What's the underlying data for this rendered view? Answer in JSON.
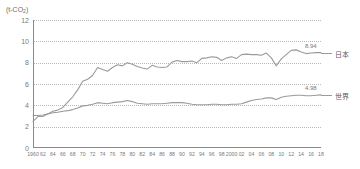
{
  "chart_data": {
    "type": "line",
    "title": "",
    "subtitle": "",
    "unit_label": "(t-CO2)",
    "unit_label_base": "(t-CO",
    "unit_label_sub": "2",
    "unit_label_tail": ")",
    "xlabel": "",
    "ylabel": "",
    "ylim": [
      0,
      12
    ],
    "xlim": [
      1960,
      2018
    ],
    "grid": true,
    "legend_position": "right-inline",
    "y_ticks": [
      "12",
      "10",
      "8",
      "6",
      "4",
      "2",
      "0"
    ],
    "y_tick_values": [
      12,
      10,
      8,
      6,
      4,
      2,
      0
    ],
    "x_ticks": [
      "1960",
      "62",
      "64",
      "66",
      "68",
      "70",
      "72",
      "74",
      "76",
      "78",
      "80",
      "82",
      "84",
      "86",
      "88",
      "90",
      "92",
      "94",
      "96",
      "98",
      "2000",
      "02",
      "04",
      "06",
      "08",
      "10",
      "12",
      "14",
      "16",
      "18"
    ],
    "x_tick_values": [
      1960,
      1962,
      1964,
      1966,
      1968,
      1970,
      1972,
      1974,
      1976,
      1978,
      1980,
      1982,
      1984,
      1986,
      1988,
      1990,
      1992,
      1994,
      1996,
      1998,
      2000,
      2002,
      2004,
      2006,
      2008,
      2010,
      2012,
      2014,
      2016,
      2018
    ],
    "x": [
      1960,
      1961,
      1962,
      1963,
      1964,
      1965,
      1966,
      1967,
      1968,
      1969,
      1970,
      1971,
      1972,
      1973,
      1974,
      1975,
      1976,
      1977,
      1978,
      1979,
      1980,
      1981,
      1982,
      1983,
      1984,
      1985,
      1986,
      1987,
      1988,
      1989,
      1990,
      1991,
      1992,
      1993,
      1994,
      1995,
      1996,
      1997,
      1998,
      1999,
      2000,
      2001,
      2002,
      2003,
      2004,
      2005,
      2006,
      2007,
      2008,
      2009,
      2010,
      2011,
      2012,
      2013,
      2014,
      2015,
      2016,
      2017,
      2018
    ],
    "series": [
      {
        "name": "日本",
        "color": "#9a9a9a",
        "end_value_label": "8.94",
        "end_value": 8.94,
        "values": [
          2.5,
          2.95,
          2.95,
          3.2,
          3.45,
          3.55,
          3.8,
          4.3,
          4.8,
          5.45,
          6.25,
          6.45,
          6.8,
          7.55,
          7.35,
          7.2,
          7.55,
          7.8,
          7.7,
          8.0,
          7.85,
          7.65,
          7.5,
          7.4,
          7.75,
          7.6,
          7.55,
          7.6,
          8.05,
          8.2,
          8.1,
          8.1,
          8.15,
          8.0,
          8.4,
          8.45,
          8.55,
          8.5,
          8.2,
          8.45,
          8.55,
          8.4,
          8.75,
          8.8,
          8.75,
          8.75,
          8.7,
          8.9,
          8.45,
          7.7,
          8.35,
          8.75,
          9.15,
          9.2,
          9.0,
          8.85,
          8.9,
          8.94,
          8.94
        ]
      },
      {
        "name": "世界",
        "color": "#9a9a9a",
        "end_value_label": "4.98",
        "end_value": 4.98,
        "values": [
          3.05,
          3.05,
          3.1,
          3.2,
          3.3,
          3.35,
          3.45,
          3.5,
          3.6,
          3.75,
          3.95,
          4.0,
          4.1,
          4.25,
          4.2,
          4.15,
          4.25,
          4.3,
          4.35,
          4.45,
          4.35,
          4.2,
          4.15,
          4.1,
          4.15,
          4.15,
          4.15,
          4.2,
          4.25,
          4.25,
          4.25,
          4.2,
          4.1,
          4.05,
          4.05,
          4.05,
          4.1,
          4.1,
          4.05,
          4.05,
          4.1,
          4.1,
          4.15,
          4.3,
          4.45,
          4.55,
          4.6,
          4.7,
          4.7,
          4.55,
          4.75,
          4.85,
          4.9,
          4.95,
          4.95,
          4.9,
          4.9,
          4.95,
          4.98
        ]
      }
    ]
  }
}
